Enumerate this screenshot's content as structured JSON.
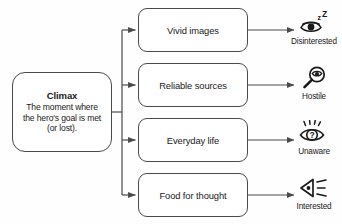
{
  "diagram": {
    "background_color": "#fefefe",
    "stroke_color": "#4a4a4a",
    "text_color": "#1a1a1a"
  },
  "climax": {
    "title": "Climax",
    "line1": "The moment where",
    "line2": "the hero's goal is met",
    "line3": "(or lost)."
  },
  "branches": [
    {
      "label": "Vivid images"
    },
    {
      "label": "Reliable sources"
    },
    {
      "label": "Everyday life"
    },
    {
      "label": "Food for thought"
    }
  ],
  "outcomes": [
    {
      "label": "Disinterested",
      "icon": "sleeping-eye-icon"
    },
    {
      "label": "Hostile",
      "icon": "magnifier-eye-icon"
    },
    {
      "label": "Unaware",
      "icon": "question-eye-icon"
    },
    {
      "label": "Interested",
      "icon": "speaker-waves-icon"
    }
  ]
}
